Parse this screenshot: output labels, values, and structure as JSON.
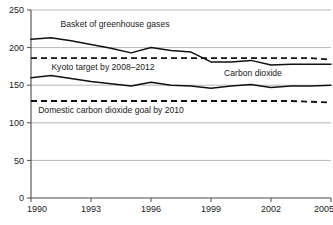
{
  "chart_data": {
    "type": "line",
    "title": "",
    "subtitle": "",
    "xlabel": "",
    "ylabel": "",
    "xlim": [
      1990,
      2005
    ],
    "ylim": [
      0,
      250
    ],
    "grid": true,
    "legend_position": "inline-annotations",
    "x": [
      1990,
      1991,
      1992,
      1993,
      1994,
      1995,
      1996,
      1997,
      1998,
      1999,
      2000,
      2001,
      2002,
      2003,
      2004,
      2005
    ],
    "x_tick_labels": [
      "1990",
      "1993",
      "1996",
      "1999",
      "2002",
      "2005"
    ],
    "x_tick_values": [
      1990,
      1993,
      1996,
      1999,
      2002,
      2005
    ],
    "y_tick_labels": [
      "0",
      "50",
      "100",
      "150",
      "200",
      "250"
    ],
    "y_tick_values": [
      0,
      50,
      100,
      150,
      200,
      250
    ],
    "series": [
      {
        "name": "Basket of greenhouse gases",
        "style": "solid",
        "values": [
          211,
          213,
          209,
          204,
          199,
          193,
          200,
          196,
          194,
          181,
          181,
          183,
          177,
          178,
          178,
          178
        ]
      },
      {
        "name": "Carbon dioxide",
        "style": "solid",
        "values": [
          160,
          163,
          159,
          155,
          152,
          149,
          154,
          150,
          149,
          146,
          149,
          151,
          147,
          149,
          149,
          150
        ]
      },
      {
        "name": "Kyoto target by 2008–2012",
        "style": "dashed",
        "values": [
          186,
          186,
          186,
          186,
          186,
          186,
          186,
          186,
          186,
          186,
          186,
          186,
          186,
          186,
          186,
          184
        ]
      },
      {
        "name": "Domestic carbon dioxide goal by 2010",
        "style": "dashed",
        "values": [
          129,
          129,
          129,
          129,
          129,
          129,
          129,
          129,
          129,
          129,
          129,
          129,
          129,
          129,
          128,
          127
        ]
      }
    ],
    "annotations": [
      {
        "text": "Basket of greenhouse gases",
        "x": 1994.2,
        "y": 227
      },
      {
        "text": "Kyoto target by 2008–2012",
        "x": 1993.6,
        "y": 170
      },
      {
        "text": "Carbon dioxide",
        "x": 2001.1,
        "y": 162
      },
      {
        "text": "Domestic carbon dioxide goal by 2010",
        "x": 1994.0,
        "y": 113
      }
    ]
  }
}
